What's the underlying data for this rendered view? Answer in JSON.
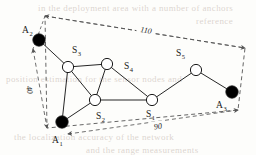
{
  "figure": {
    "background_color": "#fdfdfb",
    "line_color": "#1a1a1a",
    "anchor_fill": "#000000",
    "sensor_fill": "#ffffff",
    "dashed_color": "#555555"
  },
  "nodes": [
    {
      "id": "A2",
      "label": "A",
      "sub": "2",
      "kind": "anchor",
      "x": 39,
      "y": 40,
      "r": 6.2,
      "label_x": 22,
      "label_y": 33,
      "sub_dx": 7.5,
      "sub_dy": 2.5
    },
    {
      "id": "S3",
      "label": "S",
      "sub": "3",
      "kind": "sensor",
      "x": 68,
      "y": 67,
      "r": 5.6,
      "label_x": 72,
      "label_y": 53,
      "sub_dx": 5.5,
      "sub_dy": 2.5
    },
    {
      "id": "S4",
      "label": "S",
      "sub": "4",
      "kind": "sensor",
      "x": 107,
      "y": 64,
      "r": 5.6,
      "label_x": 124,
      "label_y": 69,
      "sub_dx": 5.5,
      "sub_dy": 2.5
    },
    {
      "id": "S5",
      "label": "S",
      "sub": "5",
      "kind": "sensor",
      "x": 196,
      "y": 70,
      "r": 5.6,
      "label_x": 176,
      "label_y": 56,
      "sub_dx": 5.5,
      "sub_dy": 2.5
    },
    {
      "id": "A3",
      "label": "A",
      "sub": "3",
      "kind": "anchor",
      "x": 232,
      "y": 92,
      "r": 6.2,
      "label_x": 216,
      "label_y": 108,
      "sub_dx": 7.5,
      "sub_dy": 2.5
    },
    {
      "id": "S1",
      "label": "S",
      "sub": "1",
      "kind": "sensor",
      "x": 152,
      "y": 100,
      "r": 5.6,
      "label_x": 146,
      "label_y": 117,
      "sub_dx": 5.5,
      "sub_dy": 2.5
    },
    {
      "id": "S2",
      "label": "S",
      "sub": "2",
      "kind": "sensor",
      "x": 95,
      "y": 100,
      "r": 5.6,
      "label_x": 96,
      "label_y": 119,
      "sub_dx": 5.5,
      "sub_dy": 2.5
    },
    {
      "id": "A1",
      "label": "A",
      "sub": "1",
      "kind": "anchor",
      "x": 62,
      "y": 122,
      "r": 6.2,
      "label_x": 52,
      "label_y": 143,
      "sub_dx": 7.5,
      "sub_dy": 2.5
    }
  ],
  "edges": [
    {
      "from": "A2",
      "to": "S3"
    },
    {
      "from": "S3",
      "to": "S4"
    },
    {
      "from": "S3",
      "to": "S2"
    },
    {
      "from": "S3",
      "to": "A1"
    },
    {
      "from": "S4",
      "to": "S2"
    },
    {
      "from": "S4",
      "to": "S1"
    },
    {
      "from": "S2",
      "to": "S1"
    },
    {
      "from": "S2",
      "to": "A1"
    },
    {
      "from": "S1",
      "to": "S5"
    },
    {
      "from": "S5",
      "to": "A3"
    }
  ],
  "boundary": {
    "corners": [
      {
        "name": "top-left",
        "x": 45,
        "y": 16
      },
      {
        "name": "top-right",
        "x": 245,
        "y": 48
      },
      {
        "name": "bottom-right",
        "x": 238,
        "y": 110
      },
      {
        "name": "bottom-left",
        "x": 47,
        "y": 128
      }
    ]
  },
  "dimensions": [
    {
      "id": "top",
      "value": "110",
      "x1": 45,
      "y1": 16,
      "x2": 245,
      "y2": 48,
      "label_x": 146,
      "label_y": 31,
      "rotate": 9
    },
    {
      "id": "left",
      "value": "40",
      "x1": 33,
      "y1": 49,
      "x2": 47,
      "y2": 128,
      "label_x": 29,
      "label_y": 90,
      "rotate": 80
    },
    {
      "id": "bottom",
      "value": "90",
      "x1": 68,
      "y1": 134,
      "x2": 238,
      "y2": 110,
      "label_x": 158,
      "label_y": 127,
      "rotate": -8
    }
  ],
  "background_artifacts": [
    {
      "text": "in the deployment area with a number of anchors",
      "x": 38,
      "y": 3
    },
    {
      "text": "reference",
      "x": 196,
      "y": 16
    },
    {
      "text": "position estimation for the sensor nodes and",
      "x": 6,
      "y": 74
    },
    {
      "text": "the localization accuracy of the network",
      "x": 14,
      "y": 132
    },
    {
      "text": "and the range measurements",
      "x": 86,
      "y": 145
    }
  ]
}
